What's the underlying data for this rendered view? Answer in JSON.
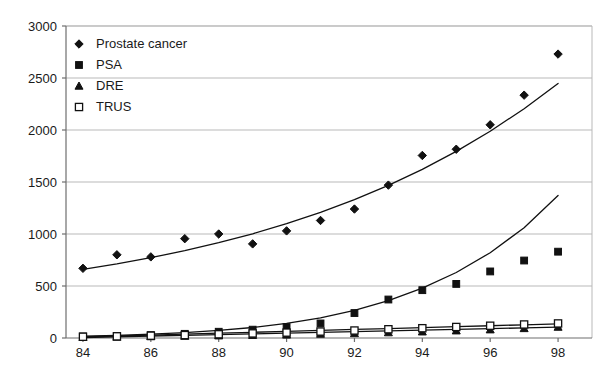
{
  "chart_data": {
    "type": "scatter",
    "title": "",
    "subtitle": "",
    "xlabel": "",
    "ylabel": "",
    "x": [
      84,
      85,
      86,
      87,
      88,
      89,
      90,
      91,
      92,
      93,
      94,
      95,
      96,
      97,
      98
    ],
    "xlim": [
      83.5,
      99.0
    ],
    "ylim": [
      0,
      3000
    ],
    "ytick_labels": [
      "0",
      "500",
      "1000",
      "1500",
      "2000",
      "2500",
      "3000"
    ],
    "ytick_values": [
      0,
      500,
      1000,
      1500,
      2000,
      2500,
      3000
    ],
    "xtick_labels": [
      "84",
      "86",
      "88",
      "90",
      "92",
      "94",
      "96",
      "98"
    ],
    "xtick_values": [
      84,
      86,
      88,
      90,
      92,
      94,
      96,
      98
    ],
    "grid": true,
    "grid_axis": "y",
    "legend_position": "top-left",
    "series": [
      {
        "name": "Prostate cancer",
        "marker": "filled-diamond",
        "color": "#111111",
        "has_trendline": true,
        "trendline_type": "exponential",
        "values": [
          670,
          800,
          780,
          955,
          1000,
          905,
          1030,
          1130,
          1240,
          1470,
          1755,
          1815,
          2050,
          2335,
          2730
        ]
      },
      {
        "name": "PSA",
        "marker": "filled-square",
        "color": "#111111",
        "has_trendline": true,
        "trendline_type": "exponential",
        "values": [
          15,
          20,
          28,
          40,
          60,
          80,
          105,
          140,
          240,
          370,
          460,
          520,
          640,
          745,
          830
        ]
      },
      {
        "name": "DRE",
        "marker": "filled-triangle",
        "color": "#111111",
        "has_trendline": true,
        "trendline_type": "linear",
        "values": [
          8,
          10,
          14,
          18,
          22,
          26,
          30,
          38,
          44,
          52,
          60,
          70,
          80,
          92,
          105
        ]
      },
      {
        "name": "TRUS",
        "marker": "open-square",
        "color": "#111111",
        "has_trendline": true,
        "trendline_type": "linear",
        "values": [
          12,
          16,
          22,
          28,
          36,
          44,
          52,
          62,
          72,
          84,
          94,
          106,
          118,
          130,
          140
        ]
      }
    ],
    "trendlines": {
      "Prostate cancer": [
        660,
        712,
        772,
        840,
        916,
        1002,
        1099,
        1208,
        1330,
        1468,
        1622,
        1795,
        1988,
        2205,
        2447
      ],
      "PSA": [
        18,
        26,
        37,
        52,
        73,
        101,
        140,
        193,
        265,
        360,
        480,
        630,
        820,
        1060,
        1370
      ],
      "DRE": [
        5,
        12,
        19,
        26,
        33,
        40,
        47,
        54,
        61,
        68,
        76,
        83,
        90,
        97,
        104
      ],
      "TRUS": [
        10,
        19,
        28,
        37,
        46,
        55,
        64,
        73,
        82,
        91,
        100,
        109,
        118,
        127,
        136
      ]
    }
  },
  "colors": {
    "ink": "#111111",
    "grid": "#b9b9b9",
    "axis": "#6e6e6e",
    "background": "#ffffff"
  }
}
